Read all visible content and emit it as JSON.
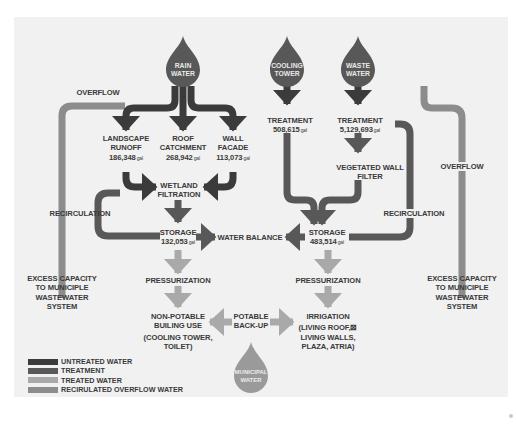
{
  "colors": {
    "untreated": "#3b3b3b",
    "treatment": "#585858",
    "treated": "#a9a9a9",
    "recirculated_overflow": "#8c8c8c",
    "background": "#f1f1f1",
    "text": "#3a3a3a",
    "municipal_drop": "#9a9a9a"
  },
  "sources": {
    "rain_water": {
      "line1": "RAIN",
      "line2": "WATER"
    },
    "cooling_tower": {
      "line1": "COOLING",
      "line2": "TOWER"
    },
    "waste_water": {
      "line1": "WASTE",
      "line2": "WATER"
    },
    "municipal_water": {
      "line1": "MUNICIPAL",
      "line2": "WATER"
    }
  },
  "nodes": {
    "landscape_runoff": {
      "line1": "LANDSCAPE",
      "line2": "RUNOFF",
      "value": "186,348",
      "unit": "gal"
    },
    "roof_catchment": {
      "line1": "ROOF",
      "line2": "CATCHMENT",
      "value": "268,942",
      "unit": "gal"
    },
    "wall_facade": {
      "line1": "WALL",
      "line2": "FACADE",
      "value": "113,073",
      "unit": "gal"
    },
    "wetland_filtration": {
      "line1": "WETLAND",
      "line2": "FILTRATION"
    },
    "storage_left": {
      "line1": "STORAGE",
      "value": "132,053",
      "unit": "gal"
    },
    "water_balance": {
      "label": "WATER BALANCE"
    },
    "storage_right": {
      "line1": "STORAGE",
      "value": "483,514",
      "unit": "gal"
    },
    "cooling_treatment": {
      "line1": "TREATMENT",
      "value": "508,615",
      "unit": "gal"
    },
    "waste_treatment": {
      "line1": "TREATMENT",
      "value": "5,129,693",
      "unit": "gal"
    },
    "vegetated_wall_filter": {
      "line1": "VEGETATED WALL",
      "line2": "FILTER"
    },
    "pressurization_left": {
      "label": "PRESSURIZATION"
    },
    "pressurization_right": {
      "label": "PRESSURIZATION"
    },
    "non_potable": {
      "line1": "NON-POTABLE",
      "line2": "BUILING USE",
      "line3": "(COOLING TOWER,",
      "line4": "TOILET)"
    },
    "potable_backup": {
      "line1": "POTABLE",
      "line2": "BACK-UP"
    },
    "irrigation": {
      "line1": "IRRIGATION",
      "line2": "(LIVING ROOF,⊠",
      "line3": "LIVING WALLS,",
      "line4": "PLAZA, ATRIA)"
    },
    "overflow_left": {
      "label": "OVERFLOW"
    },
    "overflow_right": {
      "label": "OVERFLOW"
    },
    "recirculation_left": {
      "label": "RECIRCULATION"
    },
    "recirculation_right": {
      "label": "RECIRCULATION"
    },
    "excess_left": {
      "line1": "EXCESS CAPACITY",
      "line2": "TO MUNICIPLE",
      "line3": "WASTEWATER",
      "line4": "SYSTEM"
    },
    "excess_right": {
      "line1": "EXCESS CAPACITY",
      "line2": "TO MUNICIPLE",
      "line3": "WASTEWATER",
      "line4": "SYSTEM"
    }
  },
  "legend": [
    {
      "label": "UNTREATED WATER",
      "color": "#3b3b3b"
    },
    {
      "label": "TREATMENT",
      "color": "#585858"
    },
    {
      "label": "TREATED WATER",
      "color": "#a9a9a9"
    },
    {
      "label": "RECIRULATED OVERFLOW WATER",
      "color": "#8c8c8c"
    }
  ]
}
